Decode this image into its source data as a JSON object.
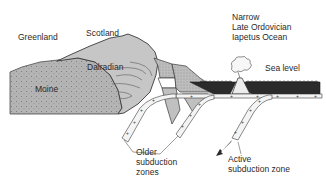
{
  "diagram": {
    "type": "geological cross-section",
    "labels": {
      "greenland": "Greenland",
      "scotland": "Scotland",
      "dalradian": "Dalradian",
      "moine": "Moine",
      "ocean": "Narrow\nLate Ordovician\nIapetus Ocean",
      "sea_level": "Sea level",
      "older_subduction": "Older\nsubduction\nzones",
      "active_subduction": "Active\nsubduction zone"
    },
    "colors": {
      "background": "#ffffff",
      "moine_fill": "#b4b4b4",
      "dalradian_fill": "#c6c6c6",
      "ocean_fill": "#2b2b2b",
      "slab_fill": "#f4f4f4",
      "outline": "#3a3a3a",
      "text": "#2a2a2a"
    }
  }
}
